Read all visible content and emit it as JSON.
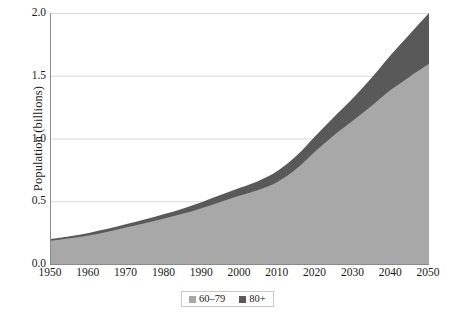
{
  "chart_data": {
    "type": "area",
    "title": "",
    "subtitle": "",
    "xlabel": "",
    "ylabel": "Population (billions)",
    "stacked": true,
    "grid": true,
    "grid_axis": "y",
    "legend_position": "bottom",
    "xlim": [
      1950,
      2050
    ],
    "ylim": [
      0.0,
      2.0
    ],
    "x": [
      1950,
      1955,
      1960,
      1965,
      1970,
      1975,
      1980,
      1985,
      1990,
      1995,
      2000,
      2005,
      2010,
      2015,
      2020,
      2025,
      2030,
      2035,
      2040,
      2045,
      2050
    ],
    "x_tick_labels": [
      "1950",
      "1960",
      "1970",
      "1980",
      "1990",
      "2000",
      "2010",
      "2020",
      "2030",
      "2040",
      "2050"
    ],
    "x_ticks": [
      1950,
      1960,
      1970,
      1980,
      1990,
      2000,
      2010,
      2020,
      2030,
      2040,
      2050
    ],
    "y_tick_labels": [
      "0.0",
      "0.5",
      "1.0",
      "1.5",
      "2.0"
    ],
    "y_ticks": [
      0.0,
      0.5,
      1.0,
      1.5,
      2.0
    ],
    "series": [
      {
        "name": "60–79",
        "color": "#a8a8a8",
        "values": [
          0.185,
          0.205,
          0.228,
          0.257,
          0.292,
          0.326,
          0.362,
          0.402,
          0.447,
          0.497,
          0.545,
          0.592,
          0.655,
          0.76,
          0.9,
          1.03,
          1.145,
          1.265,
          1.39,
          1.495,
          1.595
        ]
      },
      {
        "name": "80+",
        "color": "#595959",
        "values": [
          0.015,
          0.017,
          0.02,
          0.023,
          0.027,
          0.031,
          0.036,
          0.041,
          0.047,
          0.054,
          0.062,
          0.072,
          0.088,
          0.104,
          0.122,
          0.146,
          0.18,
          0.225,
          0.28,
          0.34,
          0.405
        ]
      }
    ],
    "totals": [
      0.2,
      0.222,
      0.248,
      0.28,
      0.319,
      0.357,
      0.398,
      0.443,
      0.494,
      0.551,
      0.607,
      0.664,
      0.743,
      0.864,
      1.022,
      1.176,
      1.325,
      1.49,
      1.67,
      1.835,
      2.0
    ]
  },
  "legend": {
    "items": [
      {
        "label": "60–79",
        "color": "#a8a8a8"
      },
      {
        "label": "80+",
        "color": "#595959"
      }
    ]
  },
  "axes": {
    "y_title": "Population (billions)",
    "axis_color": "#8a8a8a",
    "grid_color": "#d9d9d9"
  }
}
